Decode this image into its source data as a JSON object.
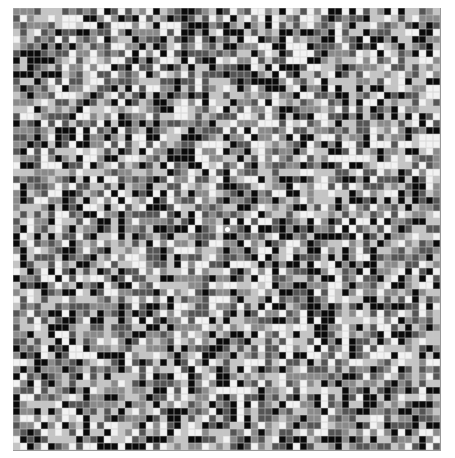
{
  "figure": {
    "columns": 61,
    "rows": 63,
    "palette": [
      "#0a0a0a",
      "#555555",
      "#8a8a8a",
      "#c4c4c4",
      "#f2f2f2"
    ],
    "center_marker": "white-dot"
  }
}
